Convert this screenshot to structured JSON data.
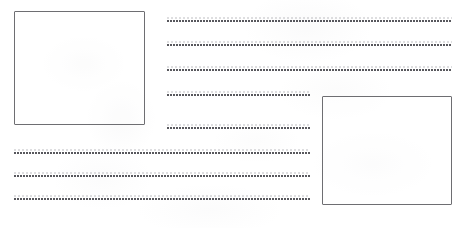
{
  "page": {
    "kind": "blank-handwriting-worksheet",
    "width": 466,
    "height": 228,
    "background_color": "#ffffff",
    "ink_color": "#4a4a50",
    "box_border_color": "#6e6e72",
    "title_text": "",
    "instructions_text": ""
  },
  "boxes": [
    {
      "name": "left-drawing-box",
      "label": "",
      "content_text": "",
      "x": 14,
      "y": 11,
      "width": 131,
      "height": 114
    },
    {
      "name": "right-drawing-box",
      "label": "",
      "content_text": "",
      "x": 322,
      "y": 96,
      "width": 130,
      "height": 109
    }
  ],
  "lines": [
    {
      "name": "writing-line-1",
      "value": "",
      "x": 167,
      "y": 20,
      "width": 285
    },
    {
      "name": "writing-line-2",
      "value": "",
      "x": 167,
      "y": 44,
      "width": 285
    },
    {
      "name": "writing-line-3",
      "value": "",
      "x": 167,
      "y": 69,
      "width": 285
    },
    {
      "name": "writing-line-4",
      "value": "",
      "x": 167,
      "y": 94,
      "width": 143
    },
    {
      "name": "writing-line-5",
      "value": "",
      "x": 167,
      "y": 127,
      "width": 143
    },
    {
      "name": "writing-line-6",
      "value": "",
      "x": 14,
      "y": 152,
      "width": 296
    },
    {
      "name": "writing-line-7",
      "value": "",
      "x": 14,
      "y": 175,
      "width": 296
    },
    {
      "name": "writing-line-8",
      "value": "",
      "x": 14,
      "y": 198,
      "width": 296
    }
  ]
}
